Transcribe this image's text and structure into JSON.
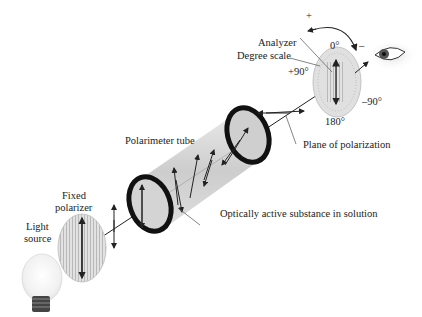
{
  "diagram": {
    "labels": {
      "analyzer": "Analyzer",
      "degree_scale": "Degree scale",
      "deg_0": "0°",
      "deg_plus90": "+90°",
      "deg_minus90": "–90°",
      "deg_180": "180°",
      "plus_sign": "+",
      "minus_sign": "–",
      "polarimeter_tube": "Polarimeter tube",
      "plane_of_polarization": "Plane of polarization",
      "fixed_polarizer_line1": "Fixed",
      "fixed_polarizer_line2": "polarizer",
      "light_source_line1": "Light",
      "light_source_line2": "source",
      "optically_active": "Optically active substance in solution"
    },
    "components": [
      "light-bulb",
      "fixed-polarizer",
      "polarimeter-tube",
      "analyzer",
      "eye"
    ],
    "colors": {
      "ring": "#111111",
      "tube": "#c9c9c9",
      "disk": "#d8d8d8",
      "line": "#222222"
    }
  }
}
